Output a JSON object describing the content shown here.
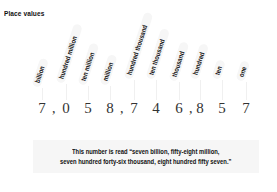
{
  "title": "Place values",
  "places": [
    {
      "label": "billion",
      "digit": "7",
      "x": 42,
      "bottom": 88,
      "comma_after": true
    },
    {
      "label": "hundred million",
      "digit": "0",
      "x": 66,
      "bottom": 84,
      "comma_after": false
    },
    {
      "label": "ten million",
      "digit": "5",
      "x": 88,
      "bottom": 86,
      "comma_after": false
    },
    {
      "label": "million",
      "digit": "8",
      "x": 110,
      "bottom": 86,
      "comma_after": true
    },
    {
      "label": "hundred thousand",
      "digit": "7",
      "x": 134,
      "bottom": 80,
      "comma_after": false
    },
    {
      "label": "ten thousand",
      "digit": "4",
      "x": 156,
      "bottom": 80,
      "comma_after": false
    },
    {
      "label": "thousand",
      "digit": "6",
      "x": 179,
      "bottom": 82,
      "comma_after": true
    },
    {
      "label": "hundred",
      "digit": "8",
      "x": 200,
      "bottom": 80,
      "comma_after": false
    },
    {
      "label": "ten",
      "digit": "5",
      "x": 222,
      "bottom": 80,
      "comma_after": false
    },
    {
      "label": "one",
      "digit": "7",
      "x": 246,
      "bottom": 82,
      "comma_after": false
    }
  ],
  "number": "7,058,746,857",
  "caption": {
    "line1": "This number is read “seven billion, fifty-eight million,",
    "line2": "seven hundred forty-six thousand, eight hundred fifty seven.”"
  },
  "colors": {
    "tag_bg": "#f6f6f6",
    "text": "#111111",
    "digit": "#333333"
  }
}
